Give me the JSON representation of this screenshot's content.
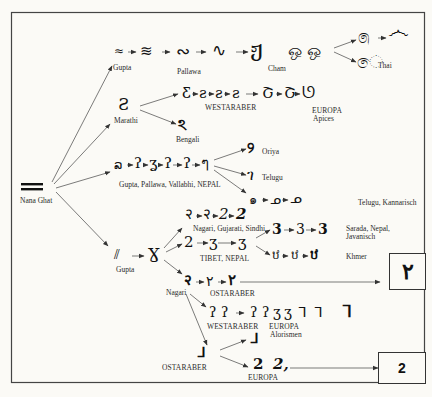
{
  "root": {
    "label": "Nana Ghat",
    "glyph": "═"
  },
  "branches": {
    "gupta_top": {
      "label": "Gupta",
      "chain": [
        "≈",
        "≋",
        "∾",
        "∿",
        "ჟ",
        "ஒ ஒ"
      ],
      "pallawa_label": "Pallawa",
      "cham_label": "Cham",
      "thai_label": "Thai",
      "end_glyphs": [
        "෧",
        "෴",
        "ෙ"
      ]
    },
    "marathi": {
      "label": "Marathi",
      "glyph": "Ƨ",
      "westaraber_label": "WESTARABER",
      "westaraber_chain": [
        "Ƹ",
        "ƨ",
        "ƨ",
        "ƨ"
      ],
      "europa_label": "EUROPA",
      "europa_sub": "Apices",
      "europa_chain": [
        "Շ",
        "Շ",
        "ᘎ"
      ],
      "bengali_label": "Bengali",
      "bengali_glyph": "ঽ"
    },
    "gupta_mid": {
      "label": "Gupta, Pallawa, Vallabhi, NEPAL",
      "chain": [
        "ລ",
        "ʔ",
        "ʓ",
        "ʔ",
        "ʔ",
        "ๆ"
      ],
      "oriya_label": "Oriya",
      "telugu_label": "Telugu",
      "telugu_kannarisch_label": "Telugu, Kannarisch",
      "oriya_glyph": "୨",
      "telugu_glyph": "ገ",
      "telugu_chain": [
        "๑",
        "ᓄ",
        "ᓄ"
      ]
    },
    "gupta_low": {
      "label": "Gupta",
      "chain": [
        "⫽",
        "Ɣ"
      ],
      "nagari_gujarati_sindhi_label": "Nagari, Gujarati, Sindhi",
      "ngs_chain": [
        "२",
        "२",
        "2",
        "2"
      ],
      "tibet_nepal_label": "TIBET, NEPAL",
      "tn_chain": [
        "2",
        "ʒ",
        "ʒ"
      ],
      "sarada_label": "Sarada, Nepal,",
      "sarada_label_2": "Javanisch",
      "sarada_chain": [
        "3",
        "3",
        "3"
      ],
      "khmer_label": "Khmer",
      "khmer_chain": [
        "ឋ",
        "ឋ",
        "ឋ"
      ],
      "nagari_label": "Nagari",
      "ostaraber_label_1": "OSTARABER",
      "ostaraber_chain": [
        "२",
        "٢",
        "٢"
      ],
      "westaraber_label": "WESTARABER",
      "westaraber_chain": [
        "ʔ",
        "ʔ",
        "ʔ",
        "ʔ",
        "ʒ",
        "ʒ",
        "ᒣ",
        "ᒣ",
        "ᒣ"
      ],
      "europa_label": "EUROPA",
      "europa_sub": "Alorismen",
      "ostaraber_label_2": "OSTARABER",
      "ostaraber2_glyphs": [
        "ᒧ",
        "ᒧ"
      ],
      "europa2_label": "EUROPA",
      "europa2_chain": [
        "2",
        "2,"
      ]
    }
  },
  "result_boxes": {
    "arabic": "٢",
    "western": "2"
  }
}
